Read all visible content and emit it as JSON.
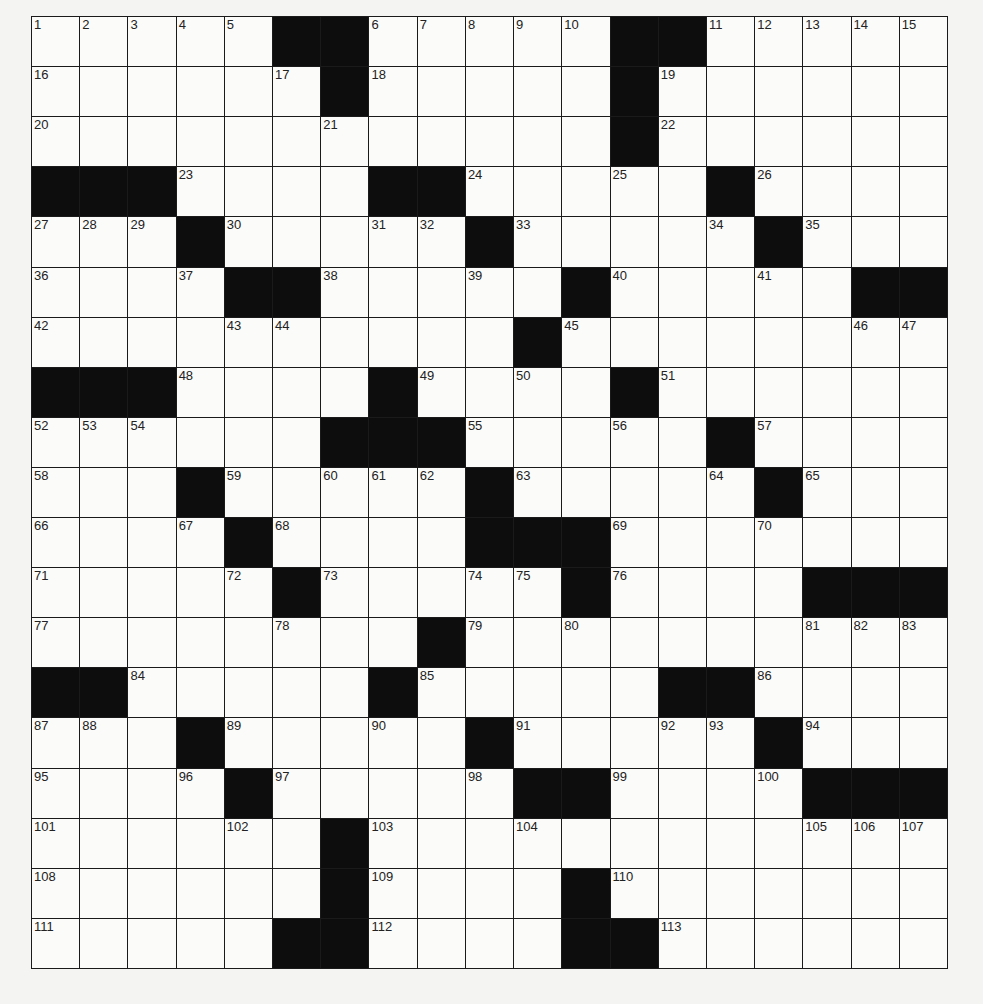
{
  "puzzle": {
    "rows": 19,
    "cols": 19,
    "layout": [
      ".....##.....##.....",
      "......#.....#......",
      "............#......",
      "###....##.....#....",
      "...#.....#.....#...",
      "....##.....#.....##",
      "..........#........",
      "###....#....#......",
      "......###.....#....",
      "...#.....#.....#...",
      "....#....###.......",
      ".....#.....#....###",
      "........#..........",
      "##.....#.....##....",
      "...#.....#.....#...",
      "....#.....##....###",
      "......#............",
      "......#....#.......",
      ".....##....##......"
    ],
    "clue_numbers": [
      1,
      2,
      3,
      4,
      5,
      6,
      7,
      8,
      9,
      10,
      11,
      12,
      13,
      14,
      15,
      16,
      17,
      18,
      19,
      20,
      21,
      22,
      23,
      24,
      25,
      26,
      27,
      28,
      29,
      30,
      31,
      32,
      33,
      34,
      35,
      36,
      37,
      38,
      39,
      40,
      41,
      42,
      43,
      44,
      45,
      46,
      47,
      48,
      49,
      50,
      51,
      52,
      53,
      54,
      55,
      56,
      57,
      58,
      59,
      60,
      61,
      62,
      63,
      64,
      65,
      66,
      67,
      68,
      69,
      70,
      71,
      72,
      73,
      74,
      75,
      76,
      77,
      78,
      79,
      80,
      81,
      82,
      83,
      84,
      85,
      86,
      87,
      88,
      89,
      90,
      91,
      92,
      93,
      94,
      95,
      96,
      97,
      98,
      99,
      100,
      101,
      102,
      103,
      104,
      105,
      106,
      107,
      108,
      109,
      110,
      111,
      112,
      113,
      114
    ],
    "colors": {
      "block": "#0d0d0d",
      "cell": "#fbfbf9",
      "line": "#1a1a1a",
      "paper": "#f4f4f2"
    }
  }
}
